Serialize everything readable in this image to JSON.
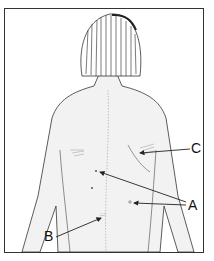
{
  "figure": {
    "labels": {
      "a": "A",
      "b": "B",
      "c": "C"
    }
  },
  "colors": {
    "line": "#333333",
    "skin": "#f2f2f2",
    "hair_dark": "#444444"
  }
}
